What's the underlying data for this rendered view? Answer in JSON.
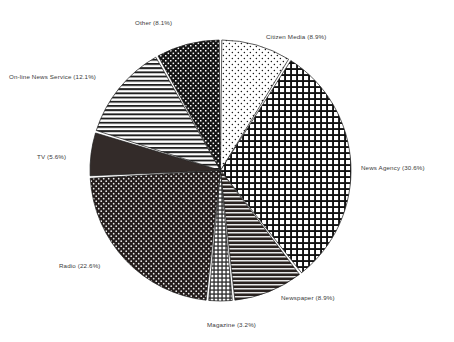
{
  "chart_data": {
    "type": "pie",
    "title": "",
    "subtitle": "",
    "xlabel": "",
    "ylabel": "",
    "legend_position": "none",
    "grid": false,
    "label_format": "{name} ({value}%)",
    "start_angle_deg": 0,
    "direction": "clockwise",
    "categories": [
      "Citizen Media",
      "News Agency",
      "Newspaper",
      "Magazine",
      "Radio",
      "TV",
      "On-line News Service",
      "Other"
    ],
    "values": [
      8.9,
      30.6,
      8.9,
      3.2,
      22.6,
      5.6,
      12.1,
      8.1
    ],
    "slices": [
      {
        "name": "Citizen Media",
        "value": 8.9,
        "label": "Citizen Media (8.9%)",
        "pattern": "sparse-dots-light",
        "fill_color": "#ffffff",
        "ink_color": "#1a1a1a"
      },
      {
        "name": "News Agency",
        "value": 30.6,
        "label": "News Agency (30.6%)",
        "pattern": "cross-hatch-grid",
        "fill_color": "#ffffff",
        "ink_color": "#111111"
      },
      {
        "name": "Newspaper",
        "value": 8.9,
        "label": "Newspaper (8.9%)",
        "pattern": "horizontal-lines-dark",
        "fill_color": "#2a2320",
        "ink_color": "#e8e8e8"
      },
      {
        "name": "Magazine",
        "value": 3.2,
        "label": "Magazine (3.2%)",
        "pattern": "fine-grid",
        "fill_color": "#ffffff",
        "ink_color": "#2b2b2b"
      },
      {
        "name": "Radio",
        "value": 22.6,
        "label": "Radio (22.6%)",
        "pattern": "dark-with-white-dots",
        "fill_color": "#241d1c",
        "ink_color": "#efefef"
      },
      {
        "name": "TV",
        "value": 5.6,
        "label": "TV (5.6%)",
        "pattern": "solid-dark",
        "fill_color": "#332b29",
        "ink_color": "#332b29"
      },
      {
        "name": "On-line News Service",
        "value": 12.1,
        "label": "On-line News Service (12.1%)",
        "pattern": "horizontal-lines-light",
        "fill_color": "#ffffff",
        "ink_color": "#1f1f1f"
      },
      {
        "name": "Other",
        "value": 8.1,
        "label": "Other (8.1%)",
        "pattern": "checker-grid-dark",
        "fill_color": "#ffffff",
        "ink_color": "#141414"
      }
    ]
  },
  "labels": {
    "citizen_media": "Citizen Media (8.9%)",
    "news_agency": "News Agency (30.6%)",
    "newspaper": "Newspaper (8.9%)",
    "magazine": "Magazine (3.2%)",
    "radio": "Radio (22.6%)",
    "tv": "TV (5.6%)",
    "online_news_service": "On-line News Service (12.1%)",
    "other": "Other (8.1%)"
  },
  "colors": {
    "background": "#ffffff",
    "ink": "#1a1a1a",
    "label_text": "#3a3a3a",
    "separator": "#ffffff"
  }
}
